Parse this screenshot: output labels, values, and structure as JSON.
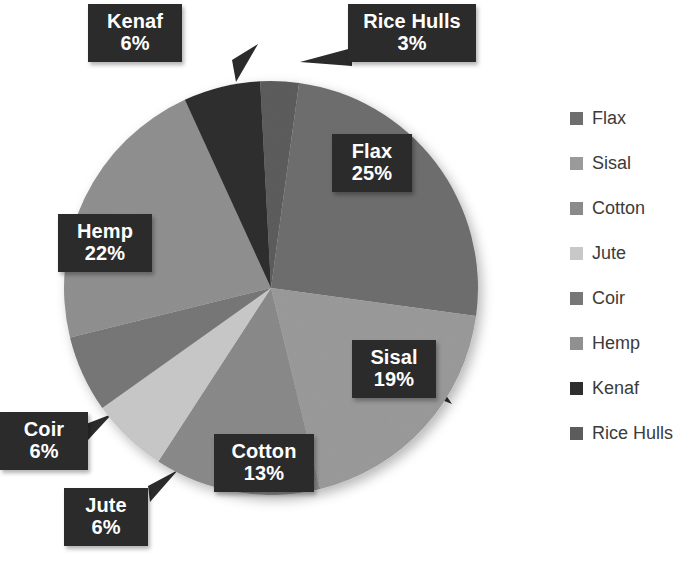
{
  "chart_data": {
    "type": "pie",
    "title": "",
    "legend_position": "right",
    "categories": [
      "Flax",
      "Sisal",
      "Cotton",
      "Jute",
      "Coir",
      "Hemp",
      "Kenaf",
      "Rice Hulls"
    ],
    "values": [
      25,
      19,
      13,
      6,
      6,
      22,
      6,
      3
    ],
    "unit": "%",
    "labels": [
      {
        "name": "Flax",
        "value": "25%"
      },
      {
        "name": "Sisal",
        "value": "19%"
      },
      {
        "name": "Cotton",
        "value": "13%"
      },
      {
        "name": "Jute",
        "value": "6%"
      },
      {
        "name": "Coir",
        "value": "6%"
      },
      {
        "name": "Hemp",
        "value": "22%"
      },
      {
        "name": "Kenaf",
        "value": "6%"
      },
      {
        "name": "Rice Hulls",
        "value": "3%"
      }
    ],
    "colors": {
      "flax": "#6e6e6e",
      "sisal": "#9a9a9a",
      "cotton": "#8a8a8a",
      "jute": "#c8c8c8",
      "coir": "#777777",
      "hemp": "#909090",
      "kenaf": "#2e2e2e",
      "rice_hulls": "#5c5c5c",
      "label_box": "#2b2b2b",
      "label_text": "#ffffff",
      "legend_text": "#3b3b3b",
      "background": "#ffffff"
    }
  },
  "legend": {
    "items": [
      {
        "label": "Flax",
        "color": "#6e6e6e"
      },
      {
        "label": "Sisal",
        "color": "#9a9a9a"
      },
      {
        "label": "Cotton",
        "color": "#8a8a8a"
      },
      {
        "label": "Jute",
        "color": "#c8c8c8"
      },
      {
        "label": "Coir",
        "color": "#777777"
      },
      {
        "label": "Hemp",
        "color": "#909090"
      },
      {
        "label": "Kenaf",
        "color": "#2e2e2e"
      },
      {
        "label": "Rice Hulls",
        "color": "#5c5c5c"
      }
    ]
  },
  "callouts": {
    "kenaf": {
      "name": "Kenaf",
      "value": "6%"
    },
    "rice_hulls": {
      "name": "Rice Hulls",
      "value": "3%"
    },
    "flax": {
      "name": "Flax",
      "value": "25%"
    },
    "hemp": {
      "name": "Hemp",
      "value": "22%"
    },
    "sisal": {
      "name": "Sisal",
      "value": "19%"
    },
    "coir": {
      "name": "Coir",
      "value": "6%"
    },
    "jute": {
      "name": "Jute",
      "value": "6%"
    },
    "cotton": {
      "name": "Cotton",
      "value": "13%"
    }
  }
}
